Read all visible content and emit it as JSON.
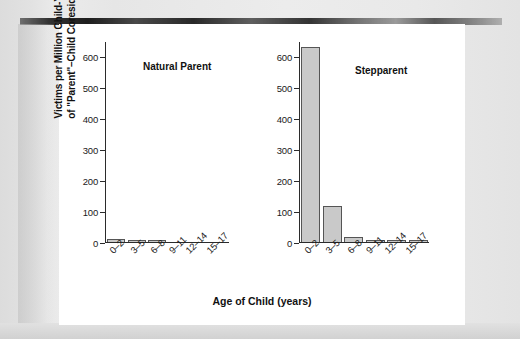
{
  "figure": {
    "xlabel": "Age of Child (years)",
    "ylabel_line1": "Victims per Million Child-Years",
    "ylabel_line2": "of \"Parent\"–Child Coresidence",
    "panel_titles": {
      "natural": "Natural Parent",
      "stepparent": "Stepparent"
    },
    "ytick_labels": [
      "600",
      "500",
      "400",
      "300",
      "200",
      "100",
      "0"
    ],
    "colors": {
      "bar_fill": "#c9c9c9",
      "bar_stroke": "#555555",
      "axis": "#2b2b2b",
      "text": "#1a1a1a",
      "panel_background": "#ffffff",
      "page_background": "#e9e9e9"
    }
  },
  "chart_data": {
    "type": "bar",
    "title": "",
    "xlabel": "Age of Child (years)",
    "ylabel": "Victims per Million Child-Years of \"Parent\"–Child Coresidence",
    "categories": [
      "0–2",
      "3–5",
      "6–8",
      "9–11",
      "12–14",
      "15–17"
    ],
    "ylim": [
      0,
      650
    ],
    "yticks": [
      0,
      100,
      200,
      300,
      400,
      500,
      600
    ],
    "grid": false,
    "legend": "none",
    "panels": [
      {
        "name": "natural",
        "title": "Natural Parent",
        "values": [
          9,
          3,
          3,
          0,
          0,
          0
        ]
      },
      {
        "name": "stepparent",
        "title": "Stepparent",
        "values": [
          632,
          115,
          17,
          7,
          7,
          7
        ]
      }
    ]
  }
}
